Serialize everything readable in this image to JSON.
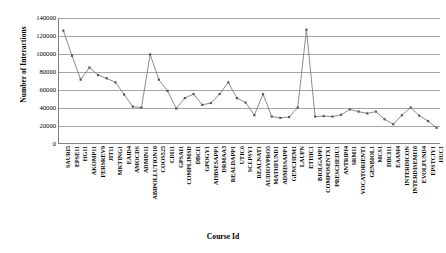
{
  "chart_data": {
    "type": "line",
    "title": "",
    "xlabel": "Course Id",
    "ylabel": "Number of Interactions",
    "ylim": [
      0,
      140000
    ],
    "ytick_step": 20000,
    "yticks": [
      "0",
      "20000",
      "40000",
      "60000",
      "80000",
      "100000",
      "120000",
      "140000"
    ],
    "grid": true,
    "legend": "none",
    "marker": "square",
    "line_color": "#7f7f7f",
    "marker_color": "#595959",
    "grid_color": "#a6a6a6",
    "axis_color": "#808080",
    "categories": [
      "SAURI5",
      "EPSE11",
      "HG11",
      "AKOMP11",
      "FERSREV9",
      "JIT11",
      "MKTING1",
      "EAID4",
      "AMOCDS",
      "ADMIN11",
      "ABIPOLLUTION10",
      "COOS525",
      "CDI11",
      "GPSAI1",
      "COMPLIMSD",
      "DBCI1",
      "GPOGY1",
      "AHBSESAPP1",
      "DRMAA3",
      "REALDAPP1",
      "UTIC6",
      "SCI.PSY1",
      "REALNAT1",
      "AUDIOVPRO5",
      "MATHFUND1",
      "ADMISSAPP1",
      "GENCHEM1",
      "LAUFN",
      "ETHIC1",
      "BIOLGAPP1",
      "COMPOSENTX1",
      "PRESCHEDU1",
      "ANTRIPI4",
      "SRM11",
      "VOCATORIENT1",
      "GENBIOL1",
      "MCS1",
      "DBCI11",
      "EAAM4",
      "INTERDICON",
      "INTERDISEMI10",
      "EVOLFUND4",
      "EPSTCIY1",
      "HUC1"
    ],
    "values": [
      126000,
      98000,
      71500,
      85000,
      76500,
      73000,
      68500,
      55000,
      41500,
      40500,
      99500,
      71500,
      59000,
      39500,
      51000,
      55500,
      43500,
      45500,
      55500,
      68500,
      51000,
      46000,
      32000,
      55500,
      30500,
      29000,
      30000,
      40500,
      127000,
      30500,
      31000,
      30500,
      32500,
      38500,
      36000,
      34000,
      36000,
      27500,
      22000,
      32000,
      40500,
      31500,
      25500,
      18000
    ]
  },
  "axis": {
    "y_title": "Number of Interactions",
    "x_title": "Course Id"
  }
}
